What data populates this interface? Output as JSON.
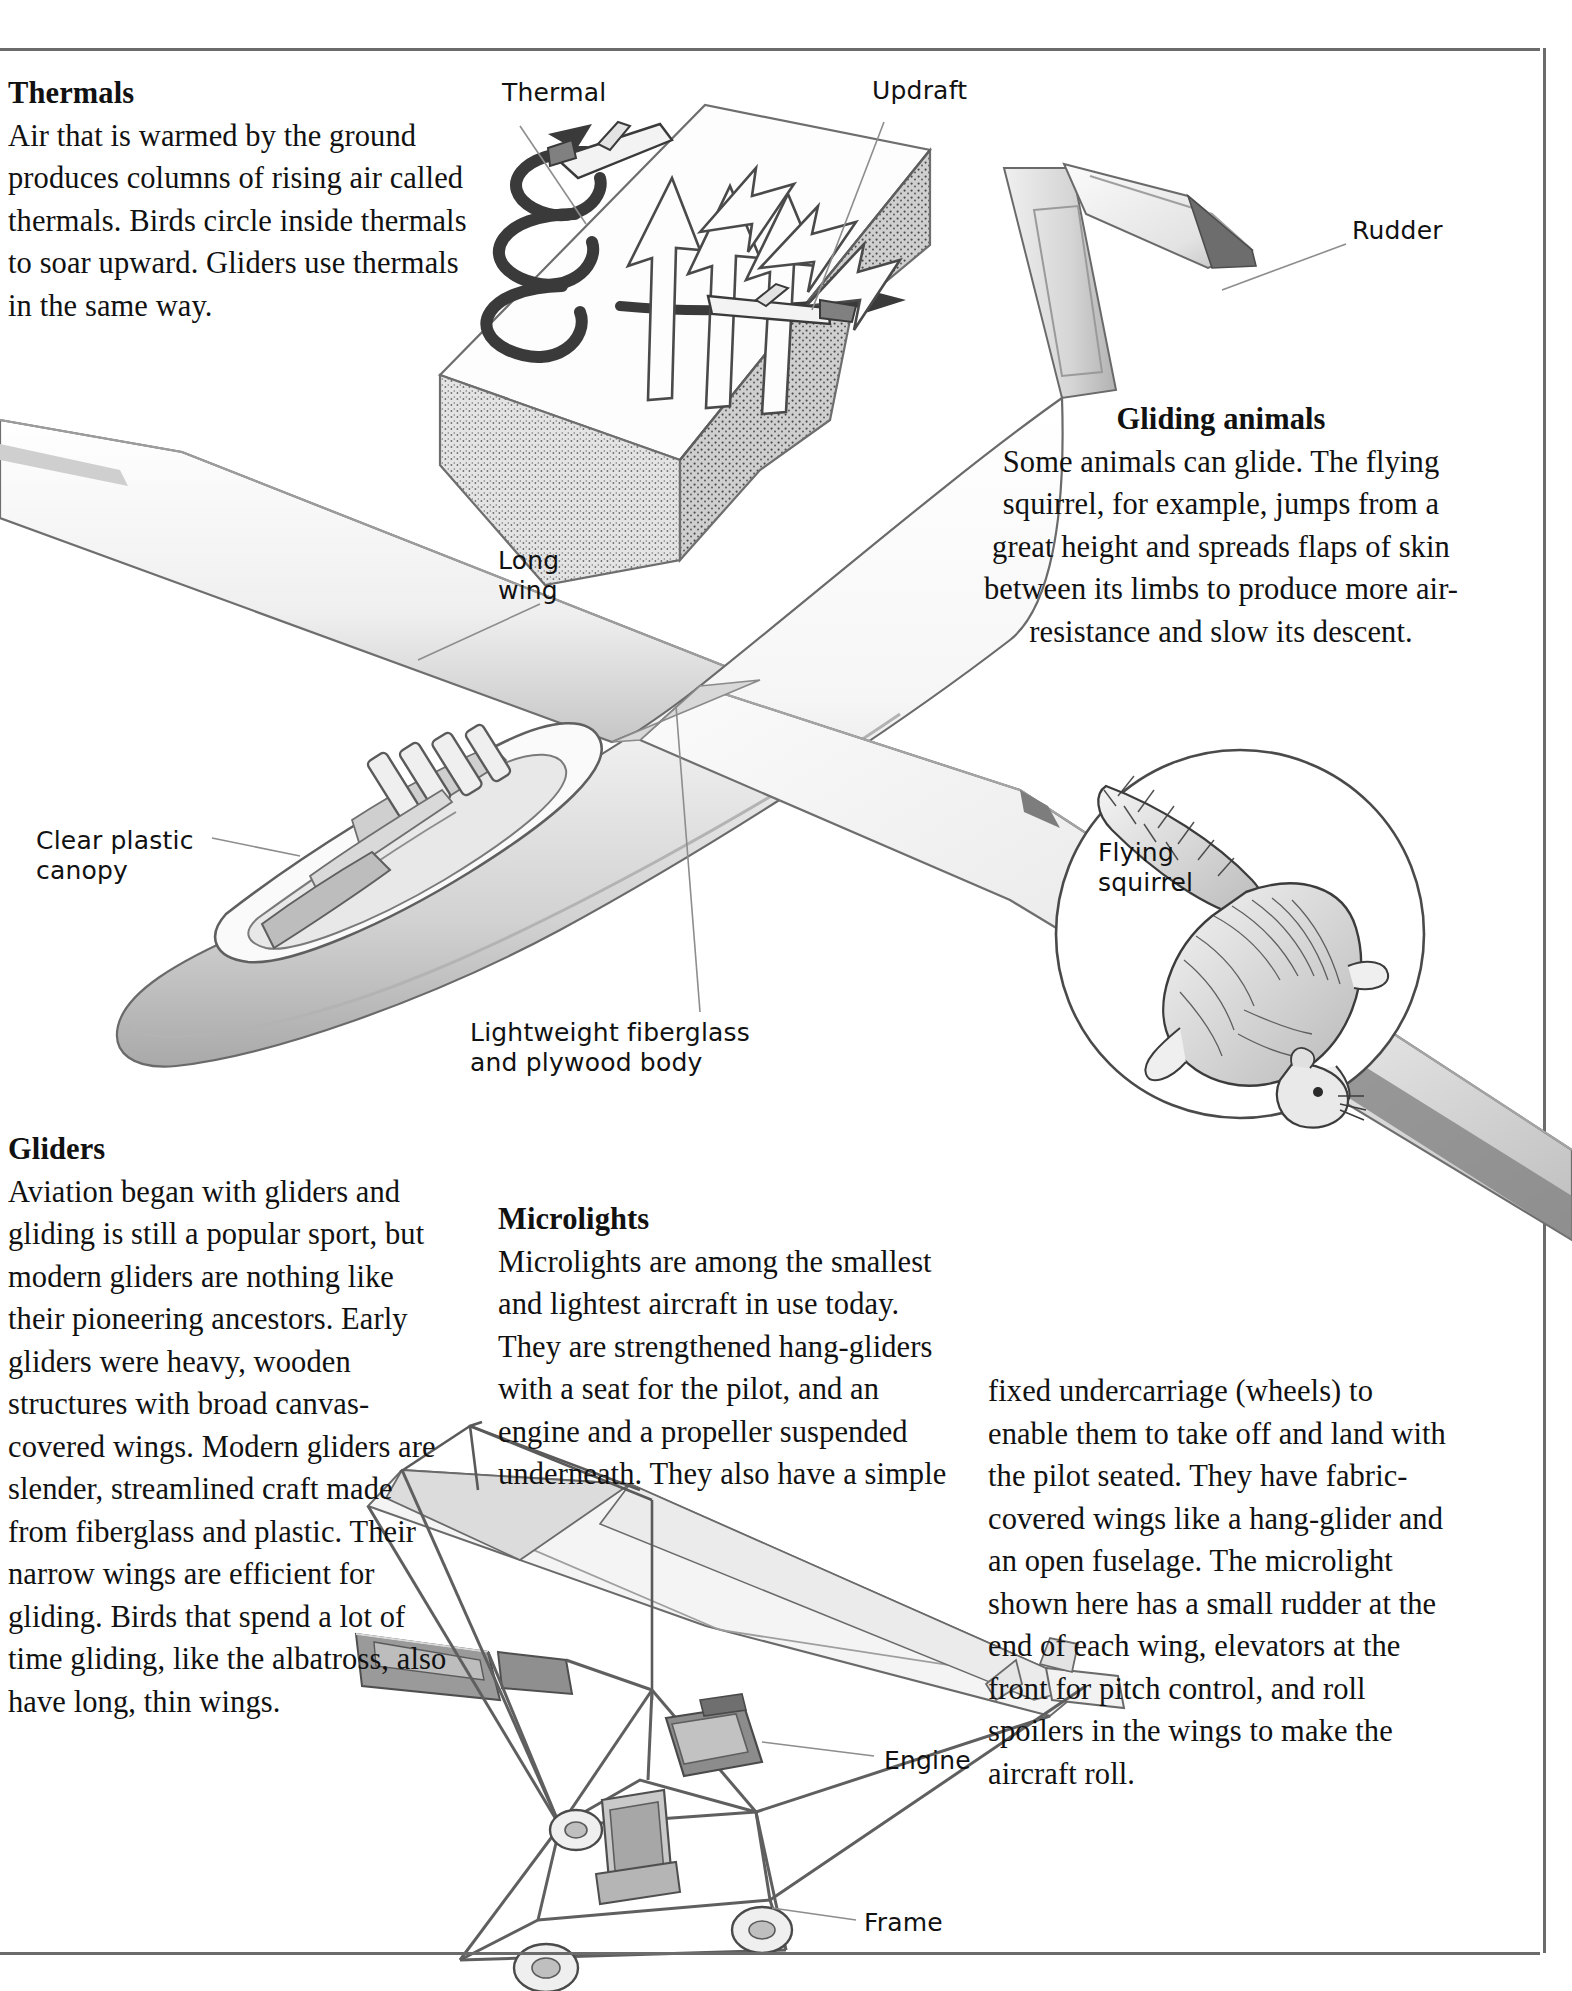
{
  "page": {
    "width": 1572,
    "height": 1991,
    "background": "#ffffff",
    "rule_color": "#6b6b6b"
  },
  "sections": {
    "thermals": {
      "heading": "Thermals",
      "body": "Air that is warmed by the ground produces columns of rising air called thermals. Birds circle inside thermals to soar upward. Gliders use thermals in the same way."
    },
    "gliding_animals": {
      "heading": "Gliding animals",
      "body": "Some animals can glide. The flying squirrel, for example, jumps from a great height and spreads flaps of skin between its limbs to produce more air-resistance and slow its descent."
    },
    "gliders": {
      "heading": "Gliders",
      "body": "Aviation began with gliders and gliding is still a popular sport, but modern gliders are nothing like their pioneering ancestors. Early gliders were heavy, wooden structures with broad canvas-covered wings. Modern gliders are slender, streamlined craft made from fiberglass and plastic. Their narrow wings are efficient for gliding. Birds that spend  a lot of time gliding, like the albatross, also have long, thin wings."
    },
    "microlights": {
      "heading": "Microlights",
      "body": "Microlights are among the smallest and lightest aircraft in use today. They are strengthened hang-gliders with a seat for the pilot, and an engine and a propeller suspended underneath. They also have a simple"
    },
    "microlights_continued": {
      "body": "fixed undercarriage (wheels) to enable them to take off and land with the pilot seated. They have fabric-covered wings like a hang-glider and an open fuselage. The microlight shown here has a small rudder at the end of each wing, elevators at the front for pitch control, and roll spoilers in the wings to make the aircraft roll."
    }
  },
  "callouts": {
    "thermal": "Thermal",
    "updraft": "Updraft",
    "rudder": "Rudder",
    "long_wing": "Long\nwing",
    "clear_plastic_canopy": "Clear plastic\ncanopy",
    "fiberglass_body": "Lightweight fiberglass\nand plywood body",
    "flying_squirrel": "Flying\nsquirrel",
    "engine": "Engine",
    "frame": "Frame"
  },
  "illustrations": {
    "thermal_diagram": "thermal-block-diagram",
    "glider": "sailplane-glider-cutaway",
    "flying_squirrel": "flying-squirrel-circle-inset",
    "microlight": "microlight-aircraft"
  },
  "colors": {
    "ink": "#111111",
    "rule": "#6b6b6b",
    "leader": "#8d8d8d",
    "shade_light": "#f2f2f2",
    "shade_mid": "#d7d7d7",
    "shade_dark": "#9a9a9a",
    "shade_darker": "#6f6f6f"
  }
}
